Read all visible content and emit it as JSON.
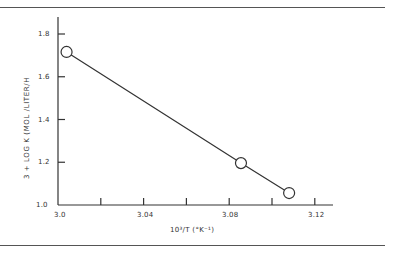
{
  "chart_data": {
    "type": "line",
    "title": "",
    "xlabel": "10³/T (°K⁻¹)",
    "ylabel": "3 + LOG K (MOL /LITER/H",
    "xlim": [
      3.0,
      3.13
    ],
    "ylim": [
      1.0,
      1.88
    ],
    "x_ticks": [
      3.0,
      3.02,
      3.04,
      3.06,
      3.08,
      3.1,
      3.12
    ],
    "x_tick_labels": [
      "3.0",
      "3.04",
      "3.08",
      "3.12"
    ],
    "y_ticks": [
      1.0,
      1.2,
      1.4,
      1.6,
      1.8
    ],
    "y_tick_labels": [
      "1.0",
      "1.2",
      "1.4",
      "1.6",
      "1.8"
    ],
    "grid": false,
    "legend": null,
    "series": [
      {
        "name": "data",
        "marker": "open-circle",
        "line": "solid",
        "x": [
          3.004,
          3.0855,
          3.108
        ],
        "y": [
          1.716,
          1.196,
          1.056
        ]
      }
    ]
  },
  "labels": {
    "x": "10³/T (°K⁻¹)",
    "y": "3 + LOG K (MOL /LITER/H",
    "xt0": "3.0",
    "xt1": "3.04",
    "xt2": "3.08",
    "xt3": "3.12",
    "yt0": "1.0",
    "yt1": "1.2",
    "yt2": "1.4",
    "yt3": "1.6",
    "yt4": "1.8"
  }
}
